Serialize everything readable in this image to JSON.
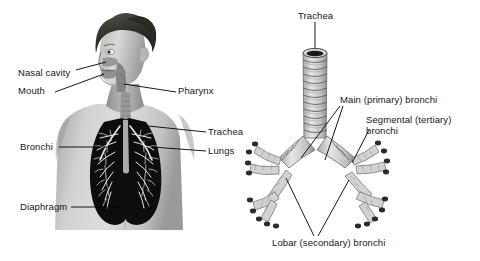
{
  "figure": {
    "background_color": "#ffffff",
    "text_color": "#161616",
    "leader_line_color": "#000000"
  },
  "left_panel": {
    "name": "human-torso-respiratory-illustration",
    "description": "Grayscale photograph of a man's head and bare chest with the airway, lungs and diaphragm overlaid",
    "labels": [
      {
        "id": "nasal-cavity",
        "text": "Nasal cavity",
        "x": 18,
        "y": 67
      },
      {
        "id": "mouth",
        "text": "Mouth",
        "x": 18,
        "y": 89
      },
      {
        "id": "pharynx",
        "text": "Pharynx",
        "x": 178,
        "y": 89
      },
      {
        "id": "trachea",
        "text": "Trachea",
        "x": 208,
        "y": 129
      },
      {
        "id": "lungs",
        "text": "Lungs",
        "x": 208,
        "y": 148
      },
      {
        "id": "bronchi",
        "text": "Bronchi",
        "x": 20,
        "y": 144
      },
      {
        "id": "diaphragm",
        "text": "Diaphragm",
        "x": 20,
        "y": 204
      }
    ]
  },
  "right_panel": {
    "name": "bronchial-tree-illustration",
    "description": "Line drawing of the trachea with cartilage rings dividing into the bronchial tree",
    "labels": [
      {
        "id": "trachea",
        "text": "Trachea",
        "x": 302,
        "y": 13
      },
      {
        "id": "main-primary-bronchi",
        "text": "Main (primary) bronchi",
        "x": 338,
        "y": 98
      },
      {
        "id": "segmental-tertiary-bronchi",
        "text": "Segmental (tertiary) bronchi",
        "x": 366,
        "y": 118
      },
      {
        "id": "lobar-secondary-bronchi",
        "text": "Lobar (secondary) bronchi",
        "x": 274,
        "y": 240
      }
    ]
  },
  "colors": {
    "skin_light": "#d8d8d6",
    "skin_mid": "#b4b4b2",
    "skin_dark": "#8d8d8b",
    "hair_dark": "#3c3a38",
    "lung_black": "#0d0d0d",
    "cartilage_fill": "#cfcfcd",
    "cartilage_line": "#4a4a48",
    "outline": "#000000"
  }
}
